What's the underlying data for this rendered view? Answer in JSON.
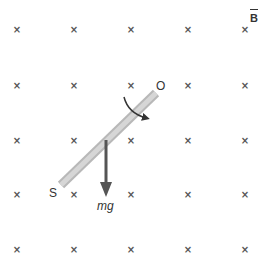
{
  "diagram": {
    "field_label": "B",
    "field_symbol": "×",
    "pivot_label": "O",
    "end_label": "S",
    "force_label": "mg",
    "grid_x": [
      17,
      74,
      131,
      188,
      245
    ],
    "grid_y": [
      30,
      86,
      141,
      195,
      250
    ],
    "colors": {
      "rod": "#cfcfcf",
      "rod_edge": "#b5b5b5",
      "arrow": "#555555",
      "marks": "#555555"
    }
  }
}
